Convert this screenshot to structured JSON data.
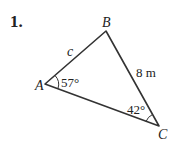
{
  "problem": {
    "number": "1.",
    "vertices": {
      "A": {
        "label": "A",
        "x": 45,
        "y": 84
      },
      "B": {
        "label": "B",
        "x": 106,
        "y": 31
      },
      "C": {
        "label": "C",
        "x": 159,
        "y": 126
      }
    },
    "side_labels": {
      "AB": "c",
      "BC": "8 m"
    },
    "angle_labels": {
      "A": "57°",
      "C": "42°"
    },
    "line_color": "#333333"
  }
}
